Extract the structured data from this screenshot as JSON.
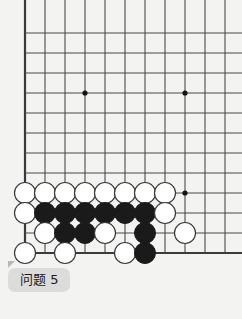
{
  "page": {
    "background_color": "#f3f3f1"
  },
  "label": {
    "text": "问题 5",
    "background_color": "#dcdcdc",
    "text_color": "#1b1b1b"
  },
  "board": {
    "name": "go-board",
    "line_color": "#4a4a4a",
    "edge_line_color": "#3a3a3a",
    "black_stone_color": "#1a1a1a",
    "white_stone_color": "#ffffff",
    "white_stone_border_color": "#3a3a3a",
    "origin_x": 25,
    "origin_y": 33,
    "spacing": 20,
    "cols": 11,
    "rows": 12,
    "left_edge_col": 0,
    "bottom_edge_row": 11,
    "star_points": [
      {
        "col": 3,
        "row": 3
      },
      {
        "col": 8,
        "row": 3
      },
      {
        "col": 8,
        "row": 8
      }
    ],
    "stones": [
      {
        "col": 0,
        "row": 8,
        "color": "white"
      },
      {
        "col": 1,
        "row": 8,
        "color": "white"
      },
      {
        "col": 2,
        "row": 8,
        "color": "white"
      },
      {
        "col": 3,
        "row": 8,
        "color": "white"
      },
      {
        "col": 4,
        "row": 8,
        "color": "white"
      },
      {
        "col": 5,
        "row": 8,
        "color": "white"
      },
      {
        "col": 6,
        "row": 8,
        "color": "white"
      },
      {
        "col": 7,
        "row": 8,
        "color": "white"
      },
      {
        "col": 0,
        "row": 9,
        "color": "white"
      },
      {
        "col": 1,
        "row": 9,
        "color": "black"
      },
      {
        "col": 2,
        "row": 9,
        "color": "black"
      },
      {
        "col": 3,
        "row": 9,
        "color": "black"
      },
      {
        "col": 4,
        "row": 9,
        "color": "black"
      },
      {
        "col": 5,
        "row": 9,
        "color": "black"
      },
      {
        "col": 6,
        "row": 9,
        "color": "black"
      },
      {
        "col": 7,
        "row": 9,
        "color": "white"
      },
      {
        "col": 1,
        "row": 10,
        "color": "white"
      },
      {
        "col": 2,
        "row": 10,
        "color": "black"
      },
      {
        "col": 3,
        "row": 10,
        "color": "black"
      },
      {
        "col": 4,
        "row": 10,
        "color": "white"
      },
      {
        "col": 6,
        "row": 10,
        "color": "black"
      },
      {
        "col": 8,
        "row": 10,
        "color": "white"
      },
      {
        "col": 0,
        "row": 11,
        "color": "white"
      },
      {
        "col": 2,
        "row": 11,
        "color": "white"
      },
      {
        "col": 5,
        "row": 11,
        "color": "white"
      },
      {
        "col": 6,
        "row": 11,
        "color": "black"
      }
    ],
    "stone_radius": 10.5,
    "star_radius": 2.6
  }
}
